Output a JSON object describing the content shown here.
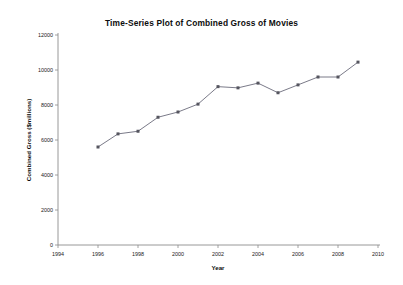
{
  "chart_data": {
    "type": "line",
    "title": "Time-Series Plot of Combined Gross of Movies",
    "xlabel": "Year",
    "ylabel": "Combined Gross ($millions)",
    "xlim": [
      1994,
      2010
    ],
    "ylim": [
      0,
      12000
    ],
    "x_ticks": [
      1994,
      1996,
      1998,
      2000,
      2002,
      2004,
      2006,
      2008,
      2010
    ],
    "x_tick_labels": [
      "1994",
      "1996",
      "1998",
      "2000",
      "2002",
      "2004",
      "2006",
      "2008",
      "2010"
    ],
    "y_ticks": [
      0,
      2000,
      4000,
      6000,
      8000,
      10000,
      12000
    ],
    "y_tick_labels": [
      "0",
      "2000",
      "4000",
      "6000",
      "8000",
      "10000",
      "12000"
    ],
    "grid": false,
    "legend": false,
    "legend_position": "none",
    "marker": "square",
    "line_color": "#6b6b7a",
    "marker_color": "#55555f",
    "x": [
      1996,
      1997,
      1998,
      1999,
      2000,
      2001,
      2002,
      2003,
      2004,
      2005,
      2006,
      2007,
      2008,
      2009
    ],
    "values": [
      5600,
      6350,
      6500,
      7300,
      7600,
      8050,
      9050,
      8980,
      9250,
      8700,
      9150,
      9600,
      9600,
      10450
    ],
    "series": [
      {
        "name": "Combined Gross",
        "x": [
          1996,
          1997,
          1998,
          1999,
          2000,
          2001,
          2002,
          2003,
          2004,
          2005,
          2006,
          2007,
          2008,
          2009
        ],
        "values": [
          5600,
          6350,
          6500,
          7300,
          7600,
          8050,
          9050,
          8980,
          9250,
          8700,
          9150,
          9600,
          9600,
          10450
        ]
      }
    ]
  }
}
